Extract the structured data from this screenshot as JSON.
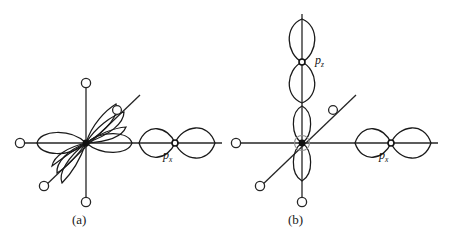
{
  "figure": {
    "background_color": "#ffffff",
    "stroke_color": "#1a1a1a",
    "type": "orbital-overlap-diagram",
    "panels": [
      {
        "id": "a",
        "caption": "(a)",
        "center": [
          86,
          143
        ],
        "ligand_atoms": [
          {
            "name": "ligand-left",
            "x": 20,
            "y": 143
          },
          {
            "name": "ligand-top",
            "x": 86,
            "y": 83
          },
          {
            "name": "ligand-bottom",
            "x": 86,
            "y": 202
          },
          {
            "name": "ligand-upper-right-diagonal",
            "x": 117,
            "y": 110
          },
          {
            "name": "ligand-lower-left-diagonal",
            "x": 44,
            "y": 186
          }
        ],
        "orbitals": [
          {
            "name": "px-orbital",
            "label": "p",
            "sub": "x",
            "center": [
              175,
              143
            ]
          }
        ]
      },
      {
        "id": "b",
        "caption": "(b)",
        "center": [
          302,
          143
        ],
        "ligand_atoms": [
          {
            "name": "ligand-left",
            "x": 236,
            "y": 143
          },
          {
            "name": "ligand-bottom",
            "x": 302,
            "y": 202
          },
          {
            "name": "ligand-upper-right-diagonal",
            "x": 333,
            "y": 110
          },
          {
            "name": "ligand-lower-left-diagonal",
            "x": 260,
            "y": 186
          }
        ],
        "orbitals": [
          {
            "name": "pz-orbital",
            "label": "p",
            "sub": "z",
            "center": [
              302,
              62
            ]
          },
          {
            "name": "px-orbital",
            "label": "p",
            "sub": "x",
            "center": [
              391,
              143
            ]
          }
        ]
      }
    ],
    "labels": {
      "caption_a": "(a)",
      "caption_b": "(b)",
      "px_a": "p",
      "px_a_sub": "x",
      "px_b": "p",
      "px_b_sub": "x",
      "pz_b": "p",
      "pz_b_sub": "z"
    }
  }
}
